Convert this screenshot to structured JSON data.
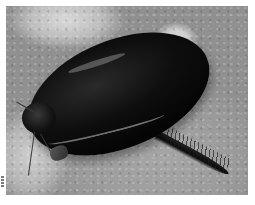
{
  "figure": {
    "colors": {
      "background": "#9c9c9c",
      "beetle": "#0e0e0e",
      "border": "#ffffff"
    }
  },
  "caption": {
    "text": ""
  }
}
